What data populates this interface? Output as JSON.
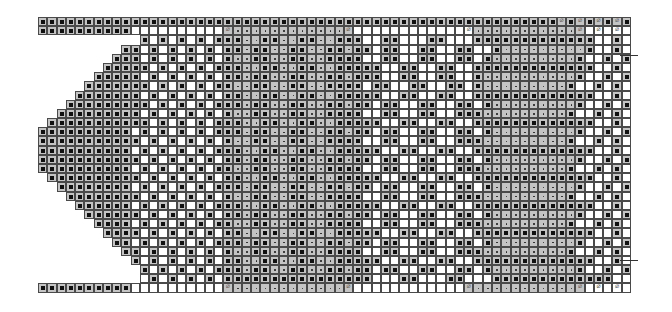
{
  "chart": {
    "cell_width": 9.28,
    "columns": 64,
    "legend": {
      "K": "knit stitch on purl background (black square)",
      "D": "purl stitch (dot on gray)",
      "O": "empty white cell",
      "Y": "yarn over on gray (CX symbol)",
      "W": "yarn over on white (CX symbol)",
      "N": "no stitch"
    },
    "rows": [
      "KKKKKKKKKKKKKKKKKKKKKKKKKKKKKKKKKKKKKKKKKKKKKKKKKKKKKKKKYKYKYKYKKK",
      "KKKKKKKKKKOOOOOOOOOOYDDDDDDDDDDDDYOOOOOOOOOOOOWDDDDDDDDDDDYOWOWOWOWOKK",
      "NNNNNNNNNNNKOKOKOKOKKKDDKKDDKKDDKKKOOKKOOOKKOOOKKKKKKKKKKKKKOOKOKOKOKK",
      "NNNNNNNNNKKOKOKOKOKOKKDKKDDKKDDKKDKKOKKOOKKOOKKOOKDDDDDDDDDKOOKOKOKOKK",
      "NNNNNNNNKKKOKOKOKOKOKDDKKDDKKDDKKKKOOKKOOKKOOKKOKDDDDDDDDDKOOKOKOKOKK",
      "NNNNNNNKKKKKOKOKOKOKKKDDKKDDKKDDKKKKKOOKKOOKKOOKKKKKKKKKKKKKOOKOKOKOKK",
      "NNNNNNKKKKKOKOKOKOKOKKDKKDDKKDDKKDKKKOOKKOOKKOOKDDDDDDDDDDKOOKOKOKOKK",
      "NNNNNKKKKKKKOKOKOKOKKDDKKDDKKDDKKKKOKKOOKKOOKKOKDDDDDDDDDKOOKOKOKOKK",
      "NNNNKKKKKKKOKOKOKOKOKKDDKKDDKKDDKKKKKOOKKOOKKOOKKKKKKKKKKKKKOOKOKOKOKK",
      "NNNKKKKKKKKKOKOKOKOKKKDKKDDKKDDKKDKKOKKOOKKOOKKOKDDDDDDDDDKOOKOKOKOKK",
      "NNKKKKKKKKKOKOKOKOKOKDDKKDDKKDDKKKKOOKKOOKKOOKKKDDDDDDDDDKOOKOKOKOKK",
      "NKKKKKKKKKKKOKOKOKOKKKDDKKDDKKDDKKKKKOOKKOOKKOOKKKKKKKKKKKKKOOKOKOKOKK",
      "KKKKKKKKKKOKOKOKOKOKKKDKKDDKKDDKKDKKOKKOOKKOOKKOKDDDDDDDDDKOOKOKOKOKK",
      "KKKKKKKKKKKOKOKOKOKOKDDKKDDKKDDKKKKOOKKOOKKOOKKKDDDDDDDDDKOOKOKOKOKK",
      "KKKKKKKKKKOKOKOKOKOKKKDDKKDDKKDDKKKKKOOKKOOKKOOKKKKKKKKKKKKKOOKOKOKOKK",
      "KKKKKKKKKKKOKOKOKOKOKKDKKDDKKDDKKDKKOKKOOKKOOKKOKDDDDDDDDDKOOKOKOKOKK",
      "KKKKKKKKKKOKOKOKOKOKKDDKKDDKKDDKKKKOOKKOOKKOOKKKDDDDDDDDDKOOKOKOKOKK",
      "NKKKKKKKKKKOKOKOKOKOKKDDKKDDKKDDKKKKKOOKKOOKKOOKKKKKKKKKKKKKOOKOKOKOKK",
      "NNKKKKKKKKOKOKOKOKOKKKDKKDDKKDDKKDKKOKKOOKKOOKKOKDDDDDDDDDKOOKOKOKOKK",
      "NNNKKKKKKKKOKOKOKOKOKDDKKDDKKDDKKKKOOKKOOKKOOKKKDDDDDDDDDKOOKOKOKOKK",
      "NNNNKKKKKKOKOKOKOKOKKKDDKKDDKKDDKKKKKOOKKOOKKOOKKKKKKKKKKKKKOOKOKOKOKK",
      "NNNNNKKKKKKOKOKOKOKOKKDKKDDKKDDKKDKKOKKOOKKOOKKOKDDDDDDDDDKOOKOKOKOKK",
      "NNNNNNKKKKOKOKOKOKOKKDDKKDDKKDDKKKKOOKKOOKKOOKKKDDDDDDDDDKOOKOKOKOKK",
      "NNNNNNNKKKKOKOKOKOKOKKDDKKDDKKDDKKKKKOOKKOOKKOOKKKKKKKKKKKKKOOKOKOKOKK",
      "NNNNNNNNKKOKOKOKOKOKKKDKKDDKKDDKKDKKOKKOOKKOOKKOKDDDDDDDDDKOOKOKOKOKK",
      "NNNNNNNNNKKOKOKOKOKOKDDKKDDKKDDKKKKOOKKOOKKOOKKKDDDDDDDDDKOOKOKOKOKK",
      "NNNNNNNNNNKOKOKOKOKOKKDDKKDDKKDDKKKKKOOKKOOKKOOKKKKKKKKKKKKKOOKOKOKOKK",
      "NNNNNNNNNNNKOKOKOKOKKKDKKDDKKDDKKDKKOKKOOKKOOKKOKDDDDDDDDDKOOKOKOKOKK",
      "NNNNNNNNNNNOKOKOKOKOKKKKKKKKKKKKKKKKOOOKKOOOKKOOOKKKKKKKKKKKKKOOKOKOKOKK",
      "KKKKKKKKKKOOOOOOOOOOYDDDDDDDDDDDDYOOOOOOOOOOOOYDDDDDDDDDDDYOWOWOWOWOKK"
    ],
    "markers": [
      {
        "side": "right",
        "after_row": 4
      },
      {
        "side": "right",
        "after_row": 26
      }
    ]
  }
}
